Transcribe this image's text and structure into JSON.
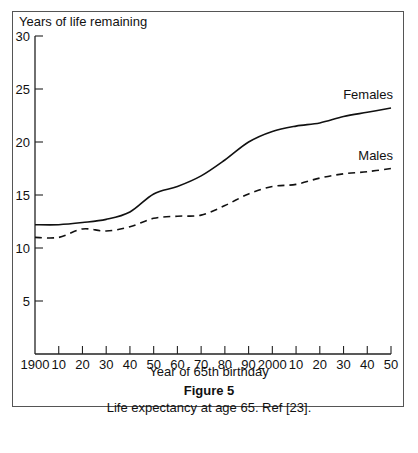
{
  "figure": {
    "title": "Figure 5",
    "caption": "Life expectancy at age 65. Ref [23]."
  },
  "chart_data": {
    "type": "line",
    "title": "",
    "xlabel": "Year of 65th birthday",
    "ylabel": "Years of life remaining",
    "x": [
      1900,
      1910,
      1920,
      1930,
      1940,
      1950,
      1960,
      1970,
      1980,
      1990,
      2000,
      2010,
      2020,
      2030,
      2040,
      2050
    ],
    "x_tick_labels": [
      "1900",
      "10",
      "20",
      "30",
      "40",
      "50",
      "60",
      "70",
      "80",
      "90",
      "2000",
      "10",
      "20",
      "30",
      "40",
      "50"
    ],
    "y_ticks": [
      5,
      10,
      15,
      20,
      25,
      30
    ],
    "ylim": [
      0,
      30
    ],
    "xlim": [
      1900,
      2050
    ],
    "grid": false,
    "legend": "inline labels at line ends",
    "series": [
      {
        "name": "Females",
        "style": "solid",
        "values": [
          12.2,
          12.2,
          12.4,
          12.7,
          13.4,
          15.1,
          15.8,
          16.8,
          18.3,
          20.0,
          21.0,
          21.5,
          21.8,
          22.4,
          22.8,
          23.2
        ]
      },
      {
        "name": "Males",
        "style": "dashed",
        "values": [
          11.0,
          11.0,
          11.8,
          11.6,
          12.0,
          12.8,
          13.0,
          13.1,
          14.0,
          15.1,
          15.8,
          16.0,
          16.6,
          17.0,
          17.2,
          17.5
        ]
      }
    ]
  }
}
